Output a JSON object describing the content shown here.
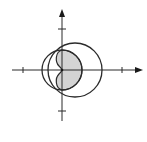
{
  "figure": {
    "colors": {
      "background": "#ffffff",
      "stroke": "#2b2b2b",
      "shade": "#d4d4d4"
    },
    "axes": {
      "origin": [
        62,
        70
      ],
      "x_axis": {
        "from": 12,
        "to": 143,
        "arrow": true,
        "ticks": [
          23,
          122
        ]
      },
      "y_axis": {
        "from": 121,
        "to": 9,
        "arrow": true,
        "ticks": [
          29,
          111
        ]
      }
    },
    "curves": [
      {
        "name": "small-circle",
        "cx": 62,
        "cy": 70,
        "r": 20
      },
      {
        "name": "large-circle",
        "cx": 75,
        "cy": 70,
        "r": 27
      }
    ],
    "shaded_region": {
      "right_extent_x": 82,
      "left_lobe_extent_x": 57,
      "top_y": 50,
      "bottom_y": 90
    }
  }
}
